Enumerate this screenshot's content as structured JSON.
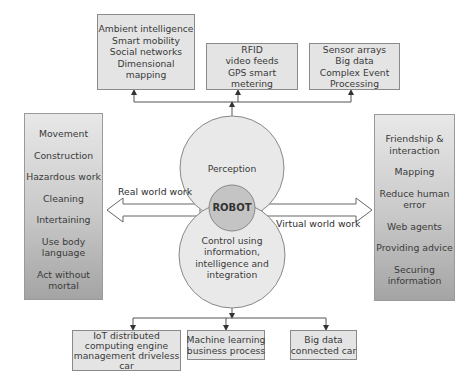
{
  "top_boxes": [
    {
      "lines": [
        "Ambient intelligence",
        "Smart mobility",
        "Social networks",
        "Dimensional",
        "mapping"
      ]
    },
    {
      "lines": [
        "RFID",
        "video feeds",
        "GPS smart",
        "metering"
      ]
    },
    {
      "lines": [
        "Sensor arrays",
        "Big data",
        "Complex Event",
        "Processing"
      ]
    }
  ],
  "left_panel": {
    "items": [
      "Movement",
      "Construction",
      "Hazardous work",
      "Cleaning",
      "Intertaining",
      "Use body\nlanguage",
      "Act without\nmortal"
    ],
    "lines": [
      [
        "Movement"
      ],
      [
        "Construction"
      ],
      [
        "Hazardous work"
      ],
      [
        "Cleaning"
      ],
      [
        "Intertaining"
      ],
      [
        "Use body",
        "language"
      ],
      [
        "Act without",
        "mortal"
      ]
    ]
  },
  "right_panel": {
    "lines": [
      [
        "Friendship &",
        "interaction"
      ],
      [
        "Mapping"
      ],
      [
        "Reduce human",
        "error"
      ],
      [
        "Web agents"
      ],
      [
        "Providing advice"
      ],
      [
        "Securing",
        "information"
      ]
    ]
  },
  "center": {
    "top_circle": "Perception",
    "core": "ROBOT",
    "bottom_circle": [
      "Control using",
      "information,",
      "intelligence and",
      "integration"
    ]
  },
  "arrows": {
    "left_label": "Real world work",
    "right_label": "Virtual world work"
  },
  "bottom_boxes": [
    {
      "lines": [
        "IoT distributed",
        "computing engine",
        "management driveless",
        "car"
      ]
    },
    {
      "lines": [
        "Machine learning",
        "business process"
      ]
    },
    {
      "lines": [
        "Big data",
        "connected car"
      ]
    }
  ],
  "colors": {
    "box_fill": "#e4e4e4",
    "circle_fill": "#e9e9e9",
    "core_fill": "#c4c4c4",
    "stroke": "#7a7a7a"
  }
}
